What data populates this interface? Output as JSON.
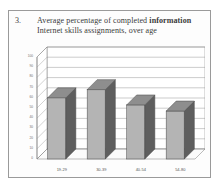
{
  "figure": {
    "number": "3.",
    "caption_prefix": "Average percentage of completed ",
    "caption_bold": "information",
    "caption_suffix": " Internet skills assignments, over age"
  },
  "colors": {
    "bar_face": "#b4b4b4",
    "bar_side": "#5e5e5e",
    "bar_top": "#8e8e8e",
    "bar_outline": "#4a4a4a",
    "grid": "#8d8d8d",
    "axis": "#7a7a7a",
    "wall": "#ffffff",
    "floor": "#fbfbfb",
    "frame": "#9a9a9a",
    "text": "#3a3a3a"
  },
  "chart_data": {
    "type": "bar",
    "title": "Average percentage of completed information Internet skills assignments, over age",
    "xlabel": "",
    "ylabel": "",
    "categories": [
      "19-29",
      "30-39",
      "40-54",
      "54-80"
    ],
    "values": [
      60,
      68,
      53,
      47
    ],
    "ylim": [
      0,
      100
    ],
    "yticks": [
      0,
      10,
      20,
      30,
      40,
      50,
      60,
      70,
      80,
      90,
      100
    ],
    "ytick_labels": [
      "0",
      "10",
      "20",
      "30",
      "40",
      "50",
      "60",
      "70",
      "80",
      "90",
      "100"
    ],
    "grid": true,
    "legend": null,
    "legend_position": "none",
    "style": "3d-column",
    "series": [
      {
        "name": "Average percentage of completed assignments",
        "values": [
          60,
          68,
          53,
          47
        ]
      }
    ]
  }
}
